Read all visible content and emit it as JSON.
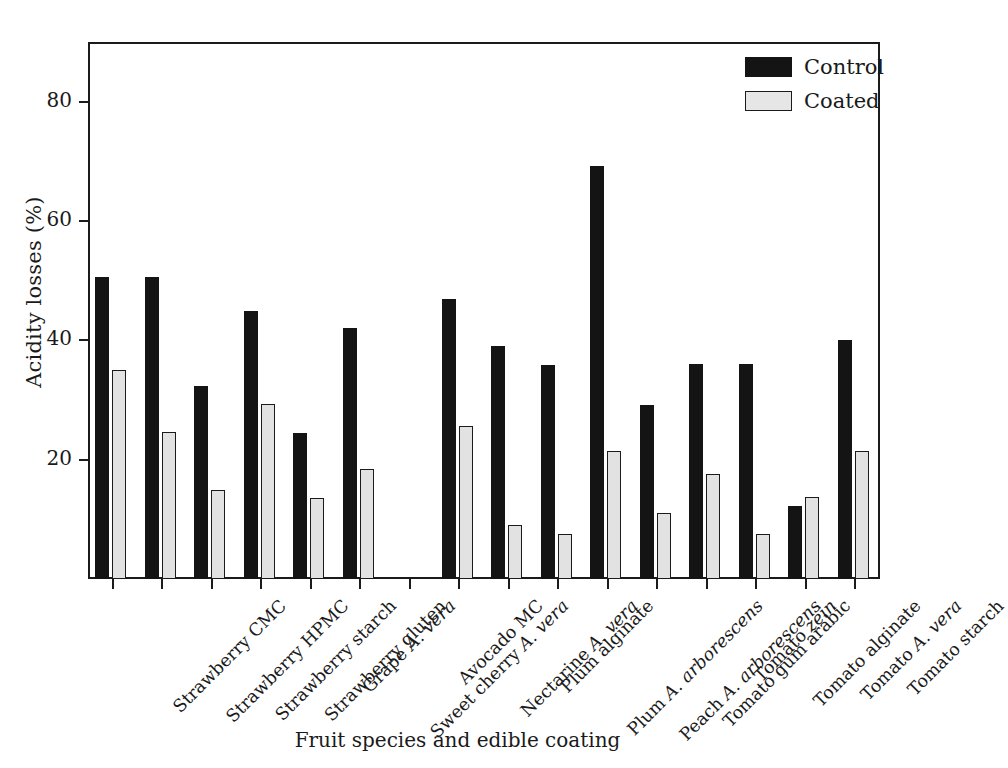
{
  "chart_data": {
    "type": "bar",
    "title": "",
    "xlabel": "Fruit species and edible coating",
    "ylabel": "Acidity losses (%)",
    "ylim": [
      0,
      90
    ],
    "yticks": [
      20,
      40,
      60,
      80
    ],
    "grid": false,
    "legend_position": "top-right",
    "categories": [
      "Strawberry CMC",
      "Strawberry HPMC",
      "Strawberry starch",
      "Strawberry gluten",
      "Grape A. vera",
      "Sweet cherry A. vera",
      "Avocado MC",
      "Nectarine A. vera",
      "Plum alginate",
      "Plum A. arborescens",
      "Peach A. arborescens",
      "Tomato gum arabic",
      "Tomato zein",
      "Tomato alginate",
      "Tomato A. vera",
      "Tomato starch"
    ],
    "categories_markup": [
      "Strawberry CMC",
      "Strawberry HPMC",
      "Strawberry starch",
      "Strawberry gluten",
      "Grape <i>A. vera</i>",
      "Sweet cherry <i>A. vera</i>",
      "Avocado MC",
      "Nectarine <i>A. vera</i>",
      "Plum alginate",
      "Plum <i>A. arborescens</i>",
      "Peach <i>A. arborescens</i>",
      "Tomato gum arabic",
      "Tomato <i>zein</i>",
      "Tomato alginate",
      "Tomato <i>A. vera</i>",
      "Tomato starch"
    ],
    "series": [
      {
        "name": "Control",
        "color": "#141414",
        "values": [
          50.6,
          50.6,
          32.3,
          45.0,
          24.5,
          42.1,
          0,
          47.0,
          39.1,
          35.9,
          69.2,
          29.1,
          36.1,
          36.1,
          12.2,
          40.1
        ]
      },
      {
        "name": "Coated",
        "color": "#e2e2e2",
        "values": [
          35.0,
          24.7,
          15.0,
          29.3,
          13.6,
          18.4,
          0,
          25.7,
          9.1,
          7.6,
          21.4,
          11.1,
          17.6,
          7.5,
          13.7,
          21.4
        ]
      }
    ]
  },
  "legend": {
    "items": [
      {
        "label": "Control",
        "style": "control"
      },
      {
        "label": "Coated",
        "style": "coated"
      }
    ]
  }
}
